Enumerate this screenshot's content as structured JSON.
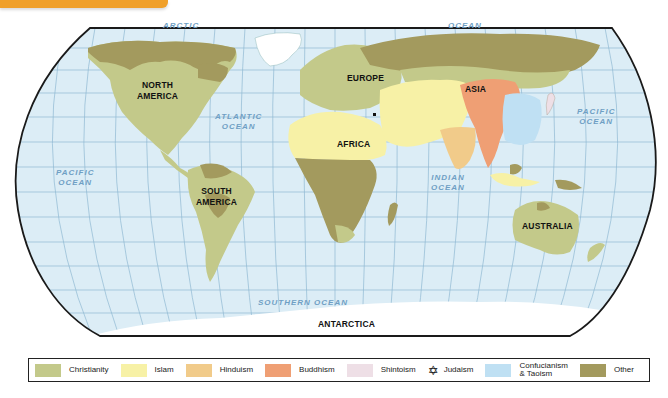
{
  "map": {
    "title_banner_color": "#f0a02a",
    "continents": [
      {
        "id": "north-america",
        "label": "NORTH\nAMERICA"
      },
      {
        "id": "south-america",
        "label": "SOUTH\nAMERICA"
      },
      {
        "id": "europe",
        "label": "EUROPE"
      },
      {
        "id": "africa",
        "label": "AFRICA"
      },
      {
        "id": "asia",
        "label": "ASIA"
      },
      {
        "id": "australia",
        "label": "AUSTRALIA"
      },
      {
        "id": "antarctica",
        "label": "ANTARCTICA"
      }
    ],
    "oceans": [
      {
        "id": "arctic",
        "label": "ARCTIC"
      },
      {
        "id": "arctic-ocean",
        "label": "OCEAN"
      },
      {
        "id": "atlantic",
        "label": "ATLANTIC\nOCEAN"
      },
      {
        "id": "pacific-west",
        "label": "PACIFIC\nOCEAN"
      },
      {
        "id": "pacific-east",
        "label": "PACIFIC\nOCEAN"
      },
      {
        "id": "indian",
        "label": "INDIAN\nOCEAN"
      },
      {
        "id": "southern",
        "label": "SOUTHERN OCEAN"
      }
    ],
    "colors": {
      "ocean": "#dcedf6",
      "grid": "#8fb9d3",
      "border": "#1a1a1a",
      "antarctica": "#ffffff",
      "greenland": "#ffffff"
    }
  },
  "legend": {
    "items": [
      {
        "label": "Christianity",
        "color": "#c3c98a",
        "type": "swatch"
      },
      {
        "label": "Islam",
        "color": "#f7f1a6",
        "type": "swatch"
      },
      {
        "label": "Hinduism",
        "color": "#f1cb8a",
        "type": "swatch"
      },
      {
        "label": "Buddhism",
        "color": "#ef9f74",
        "type": "swatch"
      },
      {
        "label": "Shintoism",
        "color": "#eedfe6",
        "type": "swatch"
      },
      {
        "label": "Judaism",
        "symbol": "✡",
        "type": "symbol"
      },
      {
        "label": "Confucianism\n& Taoism",
        "color": "#bfe0f3",
        "type": "swatch"
      },
      {
        "label": "Other",
        "color": "#a39a5e",
        "type": "swatch"
      }
    ]
  }
}
